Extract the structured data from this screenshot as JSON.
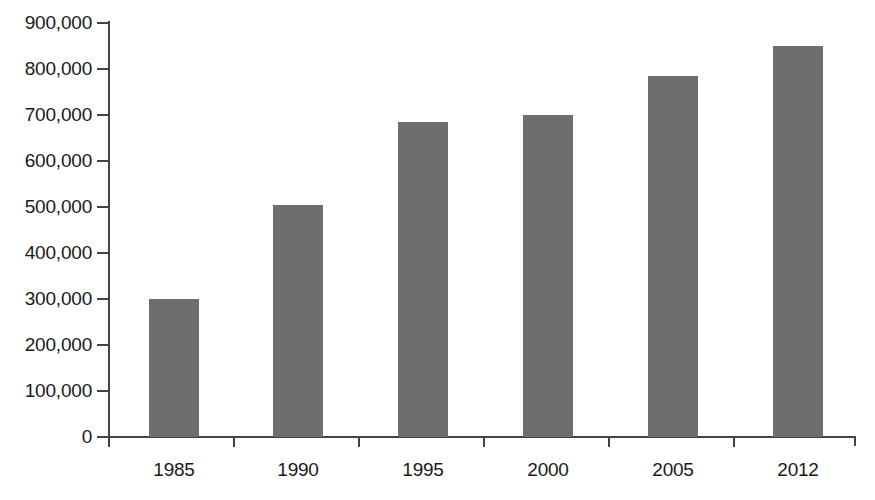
{
  "chart_data": {
    "type": "bar",
    "title": "",
    "subtitle": "",
    "xlabel": "",
    "ylabel": "",
    "categories": [
      "1985",
      "1990",
      "1995",
      "2000",
      "2005",
      "2012"
    ],
    "values": [
      300000,
      505000,
      685000,
      700000,
      785000,
      850000
    ],
    "series": [
      {
        "name": "",
        "values": [
          300000,
          505000,
          685000,
          700000,
          785000,
          850000
        ]
      }
    ],
    "ylim": [
      0,
      900000
    ],
    "ytick_values": [
      0,
      100000,
      200000,
      300000,
      400000,
      500000,
      600000,
      700000,
      800000,
      900000
    ],
    "ytick_labels": [
      "0",
      "100,000",
      "200,000",
      "300,000",
      "400,000",
      "500,000",
      "600,000",
      "700,000",
      "800,000",
      "900,000"
    ],
    "grid": false,
    "legend": null,
    "legend_position": "none",
    "annotations": [],
    "colors": {
      "bar_fill": "#6e6e6e",
      "axis": "#434343",
      "text": "#1a1a1a",
      "background": "#ffffff"
    }
  }
}
